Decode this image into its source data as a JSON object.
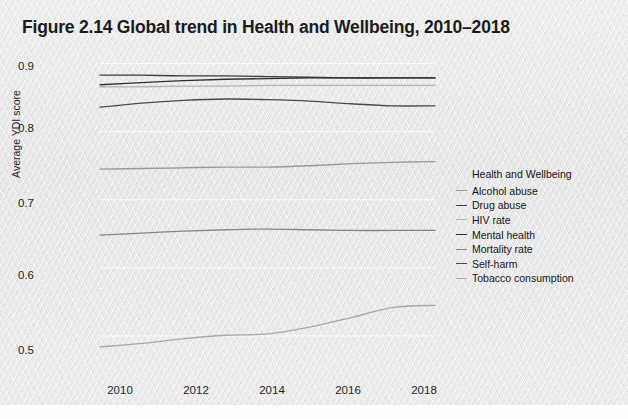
{
  "title": "Figure 2.14  Global trend in Health and Wellbeing, 2010–2018",
  "axes": {
    "ylabel": "Average YDI score",
    "yticks": [
      "0.9",
      "0.8",
      "0.7",
      "0.6",
      "0.5"
    ],
    "xticks": [
      "2010",
      "2012",
      "2014",
      "2016",
      "2018"
    ]
  },
  "legend": {
    "title": "Health and Wellbeing",
    "items": [
      {
        "label": "Alcohol abuse",
        "color": "#9a9a9a"
      },
      {
        "label": "Drug abuse",
        "color": "#3a3a3a"
      },
      {
        "label": "HIV rate",
        "color": "#b4b4b4"
      },
      {
        "label": "Mental health",
        "color": "#2f2f2f"
      },
      {
        "label": "Mortality rate",
        "color": "#868686"
      },
      {
        "label": "Self-harm",
        "color": "#4a4a4a"
      },
      {
        "label": "Tobacco consumption",
        "color": "#a8a8a8"
      }
    ]
  },
  "chart_data": {
    "type": "line",
    "title": "Figure 2.14  Global trend in Health and Wellbeing, 2010–2018",
    "xlabel": "",
    "ylabel": "Average YDI score",
    "x": [
      2010,
      2011,
      2012,
      2013,
      2014,
      2015,
      2016,
      2017,
      2018
    ],
    "xlim": [
      2010,
      2018
    ],
    "ylim": [
      0.45,
      0.92
    ],
    "yticks": [
      0.5,
      0.6,
      0.7,
      0.8,
      0.9
    ],
    "xticks": [
      2010,
      2012,
      2014,
      2016,
      2018
    ],
    "grid": true,
    "legend_position": "right",
    "series": [
      {
        "name": "Alcohol abuse",
        "color": "#9a9a9a",
        "values": [
          0.745,
          0.746,
          0.747,
          0.748,
          0.748,
          0.75,
          0.753,
          0.755,
          0.756
        ]
      },
      {
        "name": "Drug abuse",
        "color": "#3a3a3a",
        "values": [
          0.883,
          0.883,
          0.882,
          0.882,
          0.881,
          0.88,
          0.879,
          0.879,
          0.879
        ]
      },
      {
        "name": "HIV rate",
        "color": "#b4b4b4",
        "values": [
          0.866,
          0.866,
          0.867,
          0.867,
          0.868,
          0.868,
          0.868,
          0.868,
          0.868
        ]
      },
      {
        "name": "Mental health",
        "color": "#2f2f2f",
        "values": [
          0.869,
          0.872,
          0.875,
          0.877,
          0.878,
          0.879,
          0.879,
          0.879,
          0.879
        ]
      },
      {
        "name": "Mortality rate",
        "color": "#868686",
        "values": [
          0.648,
          0.651,
          0.654,
          0.656,
          0.657,
          0.656,
          0.655,
          0.655,
          0.655
        ]
      },
      {
        "name": "Self-harm",
        "color": "#4a4a4a",
        "values": [
          0.836,
          0.842,
          0.846,
          0.848,
          0.847,
          0.845,
          0.841,
          0.838,
          0.838
        ]
      },
      {
        "name": "Tobacco consumption",
        "color": "#a8a8a8",
        "values": [
          0.484,
          0.489,
          0.496,
          0.501,
          0.503,
          0.513,
          0.527,
          0.542,
          0.545
        ]
      }
    ]
  }
}
